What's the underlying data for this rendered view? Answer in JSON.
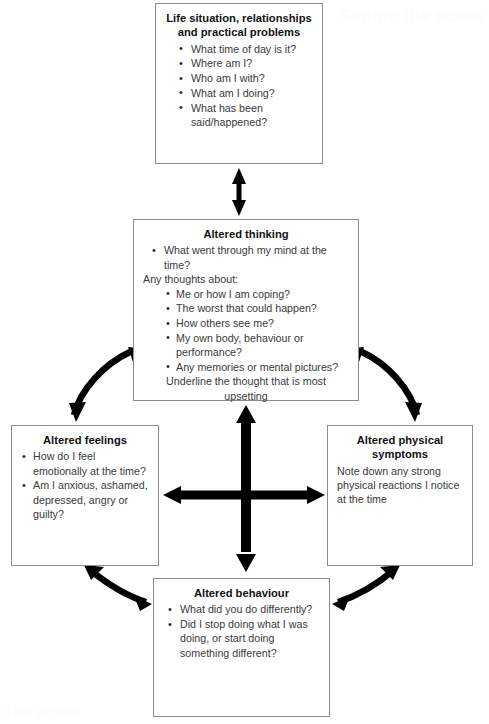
{
  "diagram": {
    "type": "cbt-five-areas-cycle",
    "page_artifacts": {
      "top_right_bleed": "Setting the scene",
      "bottom_left_bleed": "The scene"
    },
    "colors": {
      "box_border": "#8c8c8c",
      "arrow": "#000000",
      "title_text": "#111111",
      "body_text": "#3a3a3a",
      "background": "#ffffff"
    },
    "boxes": {
      "situation": {
        "id": "situation",
        "title": "Life situation, relationships and practical problems",
        "title_line_1": "Life situation, relationships",
        "title_line_2": "and practical problems",
        "bullets": [
          "What time of day is it?",
          "Where am I?",
          "Who am I with?",
          "What am I doing?",
          "What has been said/happened?"
        ]
      },
      "thinking": {
        "id": "thinking",
        "title": "Altered thinking",
        "lead_bullet": "What went through my mind at the time?",
        "prompt": "Any thoughts about:",
        "bullets": [
          "Me or how I am coping?",
          "The worst that could happen?",
          "How others see me?",
          "My own body, behaviour or performance?",
          "Any memories or mental pictures?"
        ],
        "footer": "Underline the thought that is most upsetting"
      },
      "feelings": {
        "id": "feelings",
        "title": "Altered feelings",
        "bullets": [
          "How do I feel emotionally at the time?",
          "Am I anxious, ashamed, depressed, angry or guilty?"
        ]
      },
      "physical": {
        "id": "physical",
        "title": "Altered physical symptoms",
        "body": "Note down any strong physical reactions I notice at the time"
      },
      "behaviour": {
        "id": "behaviour",
        "title": "Altered behaviour",
        "bullets": [
          "What did you do differently?",
          "Did I stop doing what I was doing, or start doing something different?"
        ]
      }
    },
    "connectors": [
      {
        "name": "situation-thinking",
        "style": "straight-vertical",
        "heads": "double"
      },
      {
        "name": "thinking-feelings",
        "style": "curved",
        "heads": "double"
      },
      {
        "name": "thinking-physical",
        "style": "curved",
        "heads": "double"
      },
      {
        "name": "feelings-behaviour",
        "style": "curved",
        "heads": "double"
      },
      {
        "name": "physical-behaviour",
        "style": "curved",
        "heads": "double"
      },
      {
        "name": "central-vertical",
        "style": "straight-vertical-thick",
        "heads": "double"
      },
      {
        "name": "central-horizontal",
        "style": "straight-horizontal-thick",
        "heads": "double"
      }
    ]
  }
}
